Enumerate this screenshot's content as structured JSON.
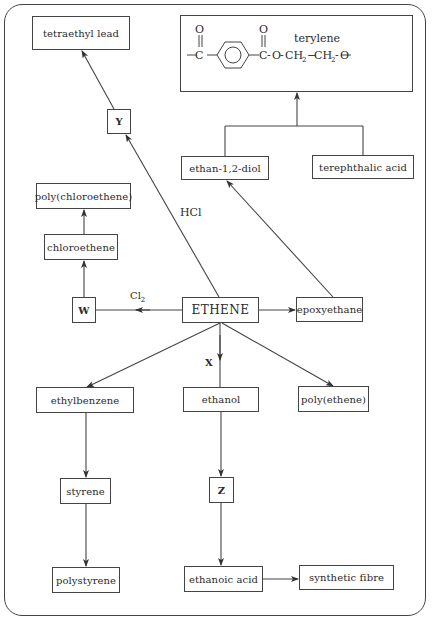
{
  "diagram": {
    "title": "",
    "center": "ETHENE",
    "nodes": {
      "tetraethyl_lead": "tetraethyl lead",
      "terylene": "terylene",
      "Y": "Y",
      "ethan_diol": "ethan-1,2-diol",
      "terephthalic_acid": "terephthalic acid",
      "poly_chloroethene": "poly(chloroethene)",
      "chloroethene": "chloroethene",
      "W": "W",
      "ethene": "ETHENE",
      "epoxyethane": "epoxyethane",
      "ethylbenzene": "ethylbenzene",
      "ethanol": "ethanol",
      "poly_ethene": "poly(ethene)",
      "styrene": "styrene",
      "Z": "Z",
      "polystyrene": "polystyrene",
      "ethanoic_acid": "ethanoic acid",
      "synthetic_fibre": "synthetic fibre"
    },
    "edge_labels": {
      "hcl": "HCl",
      "cl2_main": "Cl",
      "cl2_sub": "2",
      "x": "X"
    },
    "terylene_formula": {
      "o_top_1": "O",
      "o_top_2": "O",
      "c1": "C",
      "c2": "C",
      "chain_o1": "O",
      "ch2_a": "CH",
      "ch2_b": "CH",
      "sub_2": "2",
      "chain_o2": "O"
    },
    "edges": [
      {
        "from": "ETHENE",
        "to": "Y",
        "label": "HCl"
      },
      {
        "from": "Y",
        "to": "tetraethyl lead"
      },
      {
        "from": "ETHENE",
        "to": "W",
        "label": "Cl2"
      },
      {
        "from": "W",
        "to": "chloroethene"
      },
      {
        "from": "chloroethene",
        "to": "poly(chloroethene)"
      },
      {
        "from": "ETHENE",
        "to": "epoxyethane"
      },
      {
        "from": "epoxyethane",
        "to": "ethan-1,2-diol"
      },
      {
        "from": "ethan-1,2-diol",
        "to": "terylene"
      },
      {
        "from": "terephthalic acid",
        "to": "terylene"
      },
      {
        "from": "ETHENE",
        "to": "ethylbenzene"
      },
      {
        "from": "ETHENE",
        "to": "ethanol",
        "label": "X"
      },
      {
        "from": "ETHENE",
        "to": "poly(ethene)"
      },
      {
        "from": "ethylbenzene",
        "to": "styrene"
      },
      {
        "from": "styrene",
        "to": "polystyrene"
      },
      {
        "from": "ethanol",
        "to": "Z"
      },
      {
        "from": "Z",
        "to": "ethanoic acid"
      },
      {
        "from": "ethanoic acid",
        "to": "synthetic fibre"
      }
    ]
  }
}
